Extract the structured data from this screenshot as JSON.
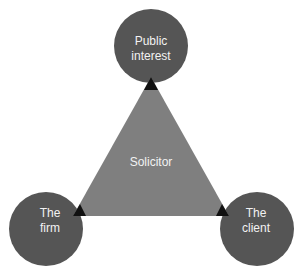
{
  "diagram": {
    "center_label": "Solicitor",
    "nodes": [
      {
        "id": "top",
        "line1": "Public",
        "line2": "interest"
      },
      {
        "id": "left",
        "line1": "The",
        "line2": "firm"
      },
      {
        "id": "right",
        "line1": "The",
        "line2": "client"
      }
    ],
    "colors": {
      "circle": "#555555",
      "triangle": "#7f7f7f",
      "overlap": "#111111",
      "text": "#f2f2f2"
    }
  }
}
